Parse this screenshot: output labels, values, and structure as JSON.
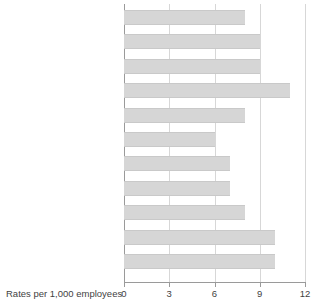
{
  "chart_data": {
    "type": "bar",
    "orientation": "horizontal",
    "title": "",
    "xlabel": "Rates per 1,000 employees",
    "ylabel": "",
    "xlim": [
      0,
      12
    ],
    "xticks": [
      0,
      3,
      6,
      9,
      12
    ],
    "xtick_labels": [
      "0",
      "3",
      "6",
      "9",
      "12"
    ],
    "grid": true,
    "legend": false,
    "bar_color": "#d6d6d6",
    "bar_edge_color": "#c9c9c9",
    "axis_color": "#9a9a9a",
    "gridline_color": "#d7d7d7",
    "text_color": "#3f3f3f",
    "categories": [
      "United Kingdom",
      "North West",
      "Yorkshire and the Humber",
      "West Midlands",
      "East",
      "London",
      "South East",
      "South West",
      "England",
      "Wales",
      "Scotland"
    ],
    "values": [
      8.0,
      9.0,
      9.0,
      11.0,
      8.0,
      6.0,
      7.0,
      7.0,
      8.0,
      10.0,
      10.0
    ],
    "emphasis": [
      true,
      false,
      false,
      false,
      false,
      false,
      false,
      false,
      true,
      true,
      true
    ],
    "series": [
      {
        "name": "Rates per 1,000 employees",
        "values": [
          8.0,
          9.0,
          9.0,
          11.0,
          8.0,
          6.0,
          7.0,
          7.0,
          8.0,
          10.0,
          10.0
        ]
      }
    ]
  }
}
